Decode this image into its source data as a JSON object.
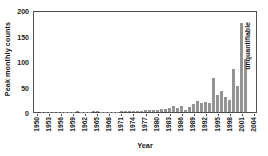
{
  "chart_data": {
    "type": "bar",
    "title": "",
    "xlabel": "Year",
    "ylabel": "Peak monthly counts",
    "ylim": [
      0,
      200
    ],
    "yticks": [
      0,
      50,
      100,
      150,
      200
    ],
    "grid": false,
    "legend": "none",
    "bar_color": "#939393",
    "axis_color": "#4d4d4d",
    "annotation": "unquantifiable",
    "xtick_step_years": 3,
    "xtick_labels": [
      "1950",
      "1953",
      "1956",
      "1959",
      "1962",
      "1965",
      "1968",
      "1971",
      "1974",
      "1977",
      "1980",
      "1983",
      "1986",
      "1989",
      "1992",
      "1995",
      "1998",
      "2001",
      "2004"
    ],
    "categories": [
      "1950",
      "1951",
      "1952",
      "1953",
      "1954",
      "1955",
      "1956",
      "1957",
      "1958",
      "1959",
      "1960",
      "1961",
      "1962",
      "1963",
      "1964",
      "1965",
      "1966",
      "1967",
      "1968",
      "1969",
      "1970",
      "1971",
      "1972",
      "1973",
      "1974",
      "1975",
      "1976",
      "1977",
      "1978",
      "1979",
      "1980",
      "1981",
      "1982",
      "1983",
      "1984",
      "1985",
      "1986",
      "1987",
      "1988",
      "1989",
      "1990",
      "1991",
      "1992",
      "1993",
      "1994",
      "1995",
      "1996",
      "1997",
      "1998",
      "1999",
      "2000",
      "2001",
      "2002",
      "2003",
      "2004"
    ],
    "values": [
      0,
      1,
      1,
      1,
      1,
      1,
      1,
      1,
      1,
      1,
      2,
      1,
      1,
      1,
      2,
      2,
      1,
      1,
      1,
      1,
      1,
      2,
      2,
      2,
      2,
      3,
      3,
      4,
      4,
      4,
      5,
      7,
      6,
      9,
      13,
      8,
      13,
      5,
      11,
      16,
      22,
      19,
      20,
      19,
      68,
      35,
      43,
      30,
      24,
      86,
      53,
      179,
      106,
      0,
      0
    ]
  }
}
